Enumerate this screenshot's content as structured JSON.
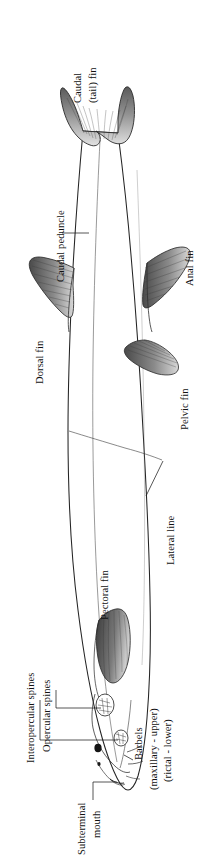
{
  "figure": {
    "orientation": "rotated-90-clockwise",
    "ink_color": "#1f1f1f",
    "background_color": "#ffffff",
    "fin_shade_color": "#6e6e6e"
  },
  "labels": {
    "caudal_fin": {
      "line1": "Caudal",
      "line2": "(tail) fin"
    },
    "caudal_peduncle": {
      "line1": "Caudal peduncle"
    },
    "dorsal_fin": {
      "line1": "Dorsal fin"
    },
    "anal_fin": {
      "line1": "Anal fin"
    },
    "pelvic_fin": {
      "line1": "Pelvic fin"
    },
    "pectoral_fin": {
      "line1": "Pectoral fin"
    },
    "lateral_line": {
      "line1": "Lateral line"
    },
    "interopercular_spines": {
      "line1": "Interopercular spines"
    },
    "opercular_spines": {
      "line1": "Opercular spines"
    },
    "barbels": {
      "line1": "Barbels",
      "line2": "(maxillary - upper)",
      "line3": "(rictal - lower)"
    },
    "subterminal_mouth": {
      "line1": "Subterminal",
      "line2": "mouth"
    }
  },
  "parts": [
    "Caudal (tail) fin",
    "Caudal peduncle",
    "Dorsal fin",
    "Anal fin",
    "Pelvic fin",
    "Pectoral fin",
    "Lateral line",
    "Interopercular spines",
    "Opercular spines",
    "Barbels (maxillary - upper)",
    "Barbels (rictal - lower)",
    "Subterminal mouth",
    "Eye",
    "Nostril"
  ]
}
